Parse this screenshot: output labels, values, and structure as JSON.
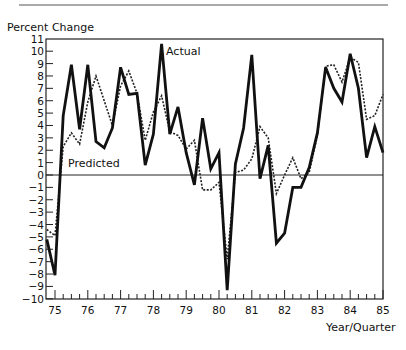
{
  "chart_data": {
    "type": "line",
    "title": "",
    "ylabel": "Percent  Change",
    "xlabel": "Year/Quarter",
    "ylim": [
      -10,
      11
    ],
    "xlim": [
      74.75,
      85.0
    ],
    "grid": false,
    "zero_line": true,
    "y_ticks": [
      11,
      10,
      9,
      8,
      7,
      6,
      5,
      4,
      3,
      2,
      1,
      0,
      -1,
      -2,
      -3,
      -4,
      -5,
      -6,
      -7,
      -8,
      -9,
      -10
    ],
    "x_ticks": [
      "75",
      "76",
      "77",
      "78",
      "79",
      "80",
      "81",
      "82",
      "83",
      "84",
      "85"
    ],
    "x_start_quarter": "74Q4",
    "quarter_step": 0.25,
    "series": [
      {
        "name": "Actual",
        "style": "solid-thick",
        "label_position": {
          "x": 166,
          "y": 55
        },
        "values": [
          -5.2,
          -8.1,
          4.8,
          8.9,
          3.7,
          8.9,
          2.7,
          2.2,
          3.8,
          8.7,
          6.5,
          6.6,
          0.8,
          3.3,
          10.6,
          3.3,
          5.5,
          1.8,
          -0.8,
          4.6,
          0.5,
          1.8,
          -9.3,
          0.9,
          3.8,
          9.7,
          -0.3,
          2.4,
          -5.5,
          -4.7,
          -1.0,
          -1.0,
          0.6,
          3.4,
          8.7,
          7.0,
          5.9,
          9.8,
          7.0,
          1.4,
          3.9,
          1.8
        ]
      },
      {
        "name": "Predicted",
        "style": "dashed",
        "label_position": {
          "x": 68,
          "y": 167
        },
        "values": [
          -4.4,
          -4.9,
          2.3,
          3.4,
          2.5,
          5.9,
          8.0,
          6.0,
          4.0,
          7.2,
          8.4,
          6.6,
          2.8,
          5.1,
          6.4,
          3.5,
          3.2,
          2.1,
          2.8,
          -1.2,
          -1.2,
          -0.6,
          -6.8,
          0.2,
          0.4,
          1.3,
          3.9,
          3.0,
          -1.5,
          0.0,
          1.4,
          -0.3,
          0.2,
          3.2,
          8.8,
          8.9,
          7.5,
          9.5,
          9.1,
          4.5,
          4.8,
          6.5
        ]
      }
    ],
    "legend": "inline labels"
  },
  "labels": {
    "ylabel": "Percent  Change",
    "xlabel": "Year/Quarter",
    "actual": "Actual",
    "predicted": "Predicted"
  }
}
